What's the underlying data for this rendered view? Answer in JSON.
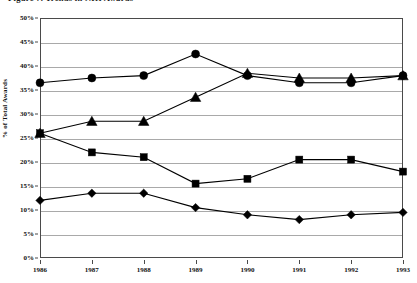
{
  "chart_data": {
    "type": "line",
    "title": "Figure 7.  Trends in NIH Awards",
    "xlabel": "",
    "ylabel": "% of Total Awards",
    "x": [
      "1986",
      "1987",
      "1988",
      "1989",
      "1990",
      "1991",
      "1992",
      "1993"
    ],
    "categories": [
      "1986",
      "1987",
      "1988",
      "1989",
      "1990",
      "1991",
      "1992",
      "1993"
    ],
    "ylim": [
      0,
      50
    ],
    "y_ticks": [
      "0%",
      "5%",
      "10%",
      "15%",
      "20%",
      "25%",
      "30%",
      "35%",
      "40%",
      "45%",
      "50%"
    ],
    "y_tick_values": [
      0,
      5,
      10,
      15,
      20,
      25,
      30,
      35,
      40,
      45,
      50
    ],
    "grid": true,
    "legend": false,
    "legend_position": "none",
    "series": [
      {
        "name": "Series 1",
        "marker": "circle",
        "color": "#000000",
        "values": [
          36.5,
          37.5,
          38.0,
          42.5,
          38.0,
          36.5,
          36.5,
          38.0
        ]
      },
      {
        "name": "Series 2",
        "marker": "triangle",
        "color": "#000000",
        "values": [
          26.0,
          28.5,
          28.5,
          33.5,
          38.5,
          37.5,
          37.5,
          38.0
        ]
      },
      {
        "name": "Series 3",
        "marker": "square",
        "color": "#000000",
        "values": [
          26.0,
          22.0,
          21.0,
          15.5,
          16.5,
          20.5,
          20.5,
          18.0
        ]
      },
      {
        "name": "Series 4",
        "marker": "diamond",
        "color": "#000000",
        "values": [
          12.0,
          13.5,
          13.5,
          10.5,
          9.0,
          8.0,
          9.0,
          9.5
        ]
      }
    ]
  }
}
